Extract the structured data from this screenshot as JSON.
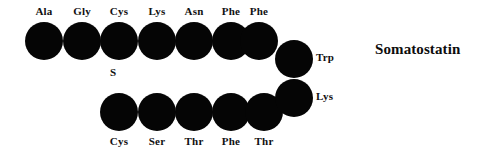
{
  "figure": {
    "title": "Somatostatin",
    "background_color": "#ffffff",
    "circle_color": "#050505",
    "text_color": "#111111",
    "disulfide_label": "S"
  },
  "top_row": {
    "label_position": "above",
    "residues": [
      {
        "label": "Ala",
        "x": 25,
        "y": 22
      },
      {
        "label": "Gly",
        "x": 63,
        "y": 22
      },
      {
        "label": "Cys",
        "x": 100,
        "y": 22
      },
      {
        "label": "Lys",
        "x": 138,
        "y": 22
      },
      {
        "label": "Asn",
        "x": 175,
        "y": 22
      },
      {
        "label": "Phe",
        "x": 212,
        "y": 22
      },
      {
        "label": "Phe",
        "x": 240,
        "y": 22
      }
    ]
  },
  "corner_column": {
    "label_position": "right",
    "residues": [
      {
        "label": "Trp",
        "x": 275,
        "y": 40
      },
      {
        "label": "Lys",
        "x": 275,
        "y": 79
      }
    ]
  },
  "bottom_row": {
    "label_position": "below",
    "residues": [
      {
        "label": "Cys",
        "x": 100,
        "y": 93
      },
      {
        "label": "Ser",
        "x": 138,
        "y": 93
      },
      {
        "label": "Thr",
        "x": 175,
        "y": 93
      },
      {
        "label": "Phe",
        "x": 212,
        "y": 93
      },
      {
        "label": "Thr",
        "x": 245,
        "y": 93
      }
    ]
  },
  "annotations": {
    "disulfide": {
      "text": "S",
      "x": 110,
      "y": 66
    },
    "title": {
      "text": "Somatostatin",
      "x": 375,
      "y": 41
    }
  }
}
